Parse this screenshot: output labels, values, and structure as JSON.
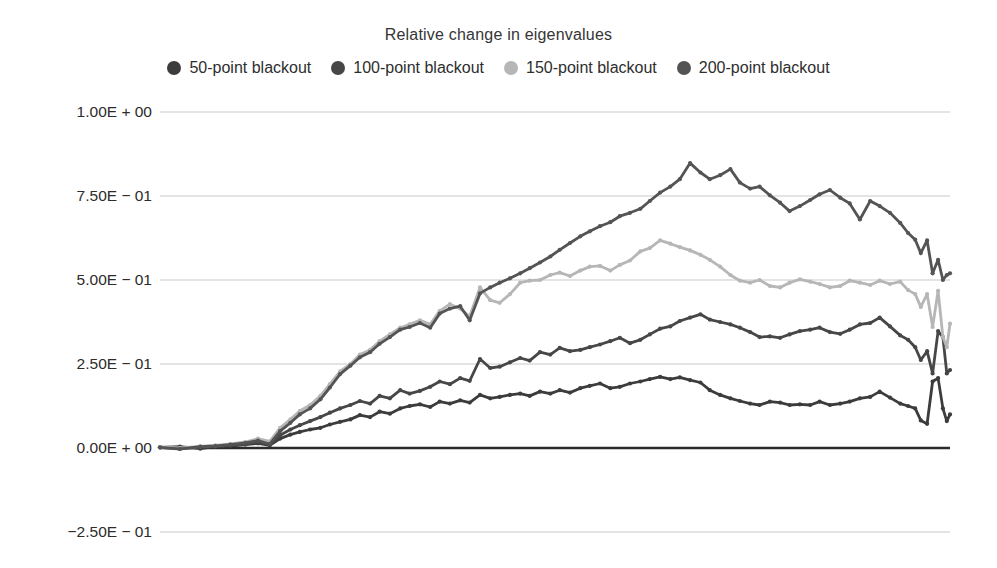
{
  "chart_data": {
    "type": "line",
    "title": "Relative change in eigenvalues",
    "xlabel": "",
    "ylabel": "",
    "x_tick_labels_visible": false,
    "legend_position": "top",
    "grid": "horizontal",
    "y_axis": {
      "range": [
        -0.25,
        1.0
      ],
      "ticks": [
        {
          "value": 1.0,
          "label": "1.00E + 00"
        },
        {
          "value": 0.75,
          "label": "7.50E − 01"
        },
        {
          "value": 0.5,
          "label": "5.00E − 01"
        },
        {
          "value": 0.25,
          "label": "2.50E − 01"
        },
        {
          "value": 0.0,
          "label": "0.00E + 00"
        },
        {
          "value": -0.25,
          "label": "−2.50E − 01"
        }
      ]
    },
    "colors": {
      "gridline": "#c9c9c9",
      "zero_line": "#2b2b2b",
      "text": "#2e2e2e"
    },
    "x_frac": [
      0.0,
      0.025,
      0.051,
      0.07,
      0.089,
      0.108,
      0.124,
      0.139,
      0.152,
      0.165,
      0.177,
      0.19,
      0.203,
      0.215,
      0.228,
      0.241,
      0.253,
      0.266,
      0.278,
      0.291,
      0.304,
      0.316,
      0.329,
      0.342,
      0.354,
      0.367,
      0.38,
      0.392,
      0.405,
      0.418,
      0.43,
      0.443,
      0.456,
      0.468,
      0.481,
      0.494,
      0.506,
      0.519,
      0.532,
      0.544,
      0.557,
      0.57,
      0.582,
      0.595,
      0.608,
      0.62,
      0.633,
      0.646,
      0.658,
      0.671,
      0.684,
      0.696,
      0.709,
      0.722,
      0.734,
      0.747,
      0.759,
      0.772,
      0.785,
      0.797,
      0.81,
      0.823,
      0.835,
      0.848,
      0.861,
      0.873,
      0.886,
      0.899,
      0.911,
      0.924,
      0.937,
      0.947,
      0.956,
      0.963,
      0.971,
      0.978,
      0.985,
      0.991,
      0.996,
      1.0
    ],
    "series": [
      {
        "name": "50-point blackout",
        "color": "#3c3c3c",
        "values": [
          0.002,
          0.004,
          -0.002,
          0.004,
          0.006,
          0.01,
          0.014,
          0.008,
          0.028,
          0.04,
          0.048,
          0.055,
          0.06,
          0.07,
          0.078,
          0.085,
          0.098,
          0.092,
          0.108,
          0.102,
          0.118,
          0.125,
          0.13,
          0.122,
          0.138,
          0.132,
          0.142,
          0.135,
          0.158,
          0.148,
          0.152,
          0.158,
          0.162,
          0.155,
          0.168,
          0.162,
          0.172,
          0.165,
          0.178,
          0.185,
          0.192,
          0.178,
          0.182,
          0.192,
          0.198,
          0.205,
          0.212,
          0.205,
          0.21,
          0.202,
          0.195,
          0.172,
          0.158,
          0.148,
          0.14,
          0.132,
          0.128,
          0.138,
          0.135,
          0.128,
          0.13,
          0.128,
          0.138,
          0.128,
          0.132,
          0.138,
          0.148,
          0.152,
          0.168,
          0.15,
          0.132,
          0.125,
          0.118,
          0.082,
          0.072,
          0.198,
          0.208,
          0.118,
          0.08,
          0.1
        ]
      },
      {
        "name": "100-point blackout",
        "color": "#474747",
        "values": [
          0.002,
          -0.002,
          0.003,
          0.005,
          0.008,
          0.012,
          0.018,
          0.01,
          0.038,
          0.055,
          0.068,
          0.08,
          0.092,
          0.105,
          0.118,
          0.128,
          0.14,
          0.132,
          0.155,
          0.148,
          0.172,
          0.162,
          0.17,
          0.182,
          0.198,
          0.19,
          0.208,
          0.2,
          0.265,
          0.238,
          0.242,
          0.255,
          0.268,
          0.26,
          0.285,
          0.278,
          0.298,
          0.288,
          0.292,
          0.3,
          0.308,
          0.318,
          0.328,
          0.312,
          0.322,
          0.338,
          0.355,
          0.362,
          0.378,
          0.388,
          0.398,
          0.382,
          0.375,
          0.368,
          0.358,
          0.345,
          0.33,
          0.332,
          0.328,
          0.338,
          0.348,
          0.352,
          0.358,
          0.345,
          0.34,
          0.352,
          0.368,
          0.372,
          0.388,
          0.362,
          0.335,
          0.322,
          0.3,
          0.262,
          0.288,
          0.222,
          0.348,
          0.33,
          0.222,
          0.232
        ]
      },
      {
        "name": "150-point blackout",
        "color": "#b6b6b6",
        "values": [
          0.003,
          0.0,
          0.005,
          0.008,
          0.012,
          0.018,
          0.028,
          0.02,
          0.06,
          0.085,
          0.11,
          0.128,
          0.155,
          0.19,
          0.228,
          0.25,
          0.278,
          0.292,
          0.318,
          0.338,
          0.358,
          0.368,
          0.38,
          0.368,
          0.408,
          0.428,
          0.415,
          0.392,
          0.478,
          0.44,
          0.432,
          0.458,
          0.492,
          0.498,
          0.5,
          0.515,
          0.522,
          0.512,
          0.528,
          0.54,
          0.542,
          0.528,
          0.545,
          0.558,
          0.585,
          0.595,
          0.618,
          0.608,
          0.598,
          0.588,
          0.575,
          0.56,
          0.54,
          0.515,
          0.498,
          0.492,
          0.5,
          0.482,
          0.478,
          0.492,
          0.502,
          0.495,
          0.488,
          0.478,
          0.482,
          0.498,
          0.492,
          0.485,
          0.498,
          0.488,
          0.495,
          0.47,
          0.458,
          0.42,
          0.458,
          0.36,
          0.468,
          0.33,
          0.3,
          0.37
        ]
      },
      {
        "name": "200-point blackout",
        "color": "#545454",
        "values": [
          0.002,
          -0.003,
          0.004,
          0.006,
          0.01,
          0.015,
          0.022,
          0.012,
          0.05,
          0.075,
          0.1,
          0.118,
          0.145,
          0.18,
          0.22,
          0.245,
          0.27,
          0.285,
          0.31,
          0.33,
          0.352,
          0.36,
          0.372,
          0.358,
          0.4,
          0.415,
          0.422,
          0.38,
          0.46,
          0.478,
          0.492,
          0.505,
          0.52,
          0.535,
          0.552,
          0.57,
          0.59,
          0.61,
          0.63,
          0.645,
          0.66,
          0.672,
          0.69,
          0.7,
          0.712,
          0.735,
          0.76,
          0.778,
          0.8,
          0.848,
          0.82,
          0.8,
          0.812,
          0.83,
          0.79,
          0.772,
          0.778,
          0.752,
          0.73,
          0.705,
          0.72,
          0.738,
          0.755,
          0.768,
          0.745,
          0.728,
          0.68,
          0.735,
          0.72,
          0.7,
          0.67,
          0.64,
          0.62,
          0.58,
          0.618,
          0.52,
          0.56,
          0.5,
          0.515,
          0.52
        ]
      }
    ]
  }
}
